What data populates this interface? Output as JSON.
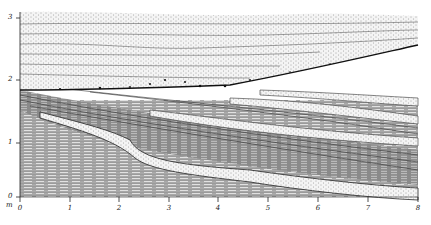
{
  "figure": {
    "type": "stratigraphic-cross-section",
    "units": "m"
  },
  "axes": {
    "y": {
      "label": "m",
      "ticks": [
        "0",
        "1",
        "2",
        "3"
      ],
      "range": [
        0,
        3
      ]
    },
    "x": {
      "ticks": [
        "0",
        "1",
        "2",
        "3",
        "4",
        "5",
        "6",
        "7",
        "8"
      ],
      "range": [
        0,
        8
      ]
    }
  },
  "units_label": "m",
  "layers": [
    {
      "name": "upper-sand",
      "pattern": "stippled",
      "description": "Stippled sand unit with near-horizontal laminae (top, ~1.8–3.1 m)"
    },
    {
      "name": "erosion-surface",
      "pattern": "dark-pebble-line",
      "description": "Erosional contact with pebble lag at ~1.8 m on left rising to ~2.6 m on right"
    },
    {
      "name": "inclined-laminated-set",
      "pattern": "dashed-laminae",
      "description": "Inclined cross-stratified silt/sand set dipping to the right"
    },
    {
      "name": "lower-laminated",
      "pattern": "dashed-laminae",
      "description": "Lower finely laminated unit (0–1.7 m)"
    },
    {
      "name": "sand-lenses",
      "pattern": "stippled",
      "description": "Stippled sand lenses interbedded within inclined set"
    }
  ],
  "colors": {
    "ink": "#2a2a2a",
    "paper": "#ffffff",
    "shade": "#9a9a9a"
  }
}
